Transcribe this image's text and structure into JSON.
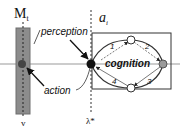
{
  "diagram": {
    "environment_label": "M",
    "environment_subscript": "t",
    "environment_bottom_label": "v",
    "agent_label": "a",
    "agent_subscript": "i",
    "agent_bottom_label": "λ*",
    "perception_label": "perception",
    "action_label": "action",
    "cognition_label": "cognition",
    "step_labels": [
      "1",
      "2",
      "3",
      "4"
    ],
    "colors": {
      "environment_bar": "#8c8c8c",
      "environment_bar_border": "#6e6e6e",
      "agent_node": "#111111",
      "cognition_end_node": "#9a9a9a",
      "cognition_node": "#ffffff",
      "box_border": "#333333",
      "axis_line": "#999999"
    }
  }
}
